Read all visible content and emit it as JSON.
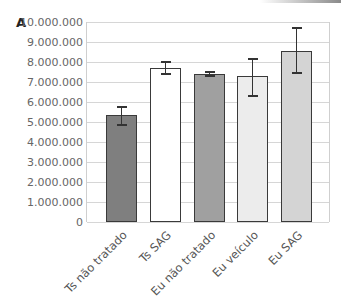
{
  "panel_label": "A",
  "chart_data": {
    "type": "bar",
    "title": "",
    "xlabel": "",
    "ylabel": "",
    "ylim": [
      0,
      10000000
    ],
    "grid": true,
    "legend": null,
    "yticks": [
      0,
      1000000,
      2000000,
      3000000,
      4000000,
      5000000,
      6000000,
      7000000,
      8000000,
      9000000,
      10000000
    ],
    "ytick_labels": [
      "0",
      "1.000.000",
      "2.000.000",
      "3.000.000",
      "4.000.000",
      "5.000.000",
      "6.000.000",
      "7.000.000",
      "8.000.000",
      "9.000.000",
      "10.000.000"
    ],
    "categories": [
      "Ts não tratado",
      "Ts SAG",
      "Eu não tratado",
      "Eu veículo",
      "Eu SAG"
    ],
    "values": [
      5350000,
      7700000,
      7400000,
      7300000,
      8550000
    ],
    "error_low": [
      4850000,
      7400000,
      7300000,
      6300000,
      7450000
    ],
    "error_high": [
      5750000,
      8000000,
      7500000,
      8150000,
      9700000
    ],
    "bar_colors": [
      "#7f7f7f",
      "#ffffff",
      "#a0a0a0",
      "#ececec",
      "#d4d4d4"
    ]
  }
}
